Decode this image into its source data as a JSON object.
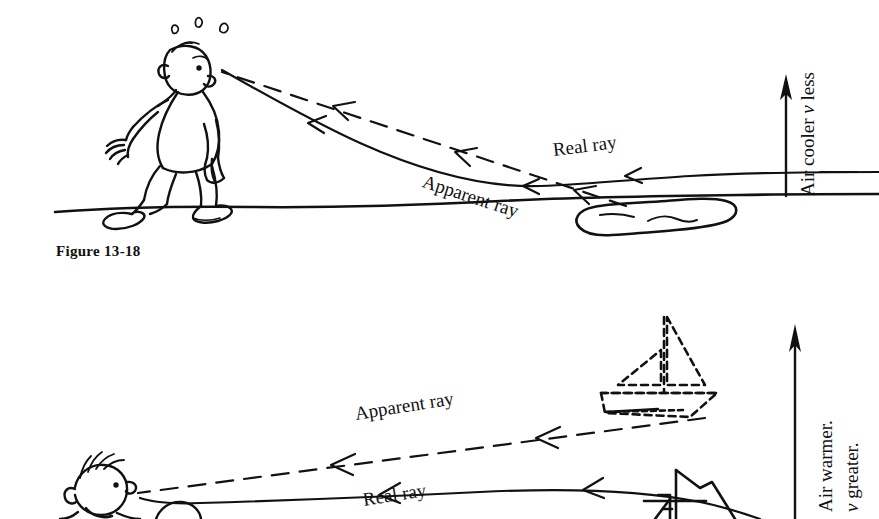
{
  "figure": {
    "caption": "Figure 13-18"
  },
  "panels": [
    {
      "id": "desert-mirage",
      "scene": "hot-desert-mirage",
      "labels": {
        "real_ray": "Real ray",
        "apparent_ray": "Apparent ray",
        "gradient_line1": "Air cooler",
        "gradient_var": "v",
        "gradient_line1_tail": "less",
        "gradient_full": "Air cooler v less"
      },
      "objects": {
        "observer": "weary-man-walking",
        "mirage": "water-puddle-mirage",
        "ground": "desert-ground-line",
        "arrow": "upward-gradient-arrow"
      }
    },
    {
      "id": "sea-mirage",
      "scene": "cold-sea-looming-mirage",
      "labels": {
        "real_ray": "Real ray",
        "apparent_ray": "Apparent ray",
        "gradient_line1": "Air warmer.",
        "gradient_var": "v",
        "gradient_line2_tail": "greater.",
        "gradient_line2": "v greater."
      },
      "objects": {
        "observer": "boy-head",
        "apparent_boat": "dashed-sailboat",
        "real_boat": "solid-sailboat",
        "arrow": "upward-gradient-arrow"
      }
    }
  ],
  "style": {
    "ink": "#111111",
    "paper": "#ffffff"
  }
}
